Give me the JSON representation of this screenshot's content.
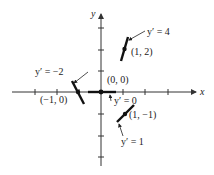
{
  "diagram": {
    "colors": {
      "ink": "#1a1a1a",
      "axis": "#333333",
      "background": "#ffffff"
    },
    "axes": {
      "x_label": "x",
      "y_label": "y",
      "origin_px": [
        101,
        92
      ],
      "unit_px": 22,
      "x_ticks": [
        -4,
        -3,
        -2,
        -1,
        1,
        2,
        3
      ],
      "y_ticks": [
        3,
        2,
        1,
        -1,
        -2,
        -3
      ]
    },
    "points": [
      {
        "point_label": "(1, 2)",
        "slope_label": "y′ = 4",
        "x": 1,
        "y": 2,
        "slope": 4
      },
      {
        "point_label": "(−1, 0)",
        "slope_label": "y′ = −2",
        "x": -1,
        "y": 0,
        "slope": -2
      },
      {
        "point_label": "(0, 0)",
        "slope_label": "y′ = 0",
        "x": 0,
        "y": 0,
        "slope": 0
      },
      {
        "point_label": "(1, −1)",
        "slope_label": "y′ = 1",
        "x": 1,
        "y": -1,
        "slope": 1
      }
    ]
  }
}
